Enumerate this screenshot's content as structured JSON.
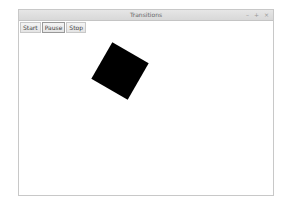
{
  "window": {
    "title": "Transitions",
    "controls": {
      "minimize": "–",
      "maximize": "+",
      "close": "×"
    }
  },
  "toolbar": {
    "buttons": [
      {
        "label": "Start"
      },
      {
        "label": "Pause"
      },
      {
        "label": "Stop"
      }
    ]
  },
  "canvas": {
    "shape": "square",
    "color": "#000000",
    "rotation_deg": 30
  }
}
